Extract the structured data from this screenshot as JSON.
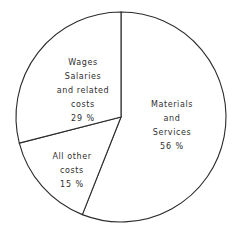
{
  "chart_data": {
    "type": "pie",
    "title": "",
    "subtitle": "",
    "xlabel": "",
    "ylabel": "",
    "legend_position": "none",
    "grid": false,
    "labels_inside": true,
    "start_angle_deg": 0,
    "direction": "clockwise",
    "categories": [
      "Materials and Services",
      "All other costs",
      "Wages Salaries and related costs"
    ],
    "values": [
      56,
      15,
      29
    ],
    "units": "percent",
    "slices": [
      {
        "name": "materials-and-services",
        "lines": [
          "Materials",
          "and",
          "Services"
        ],
        "percent_label": "56 %",
        "value": 56,
        "start_deg": 0,
        "end_deg": 201.6,
        "fill": "#ffffff",
        "stroke": "#2b2b2b"
      },
      {
        "name": "all-other-costs",
        "lines": [
          "All other",
          "costs"
        ],
        "percent_label": "15 %",
        "value": 15,
        "start_deg": 201.6,
        "end_deg": 255.6,
        "fill": "#ffffff",
        "stroke": "#2b2b2b"
      },
      {
        "name": "wages-salaries",
        "lines": [
          "Wages",
          "Salaries",
          "and related",
          "costs"
        ],
        "percent_label": "29 %",
        "value": 29,
        "start_deg": 255.6,
        "end_deg": 360,
        "fill": "#ffffff",
        "stroke": "#2b2b2b"
      }
    ],
    "geometry": {
      "center_x": 121,
      "center_y": 117,
      "radius": 105
    },
    "colors": {
      "background": "#ffffff",
      "stroke": "#2b2b2b",
      "text": "#2e2e2e"
    }
  }
}
